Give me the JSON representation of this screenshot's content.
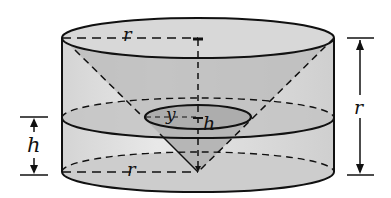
{
  "diagram": {
    "type": "geometry-figure",
    "colors": {
      "stroke": "#111111",
      "cylinder_fill": "#d9d9d9",
      "cylinder_side_light": "#e6e6e6",
      "cone_fill": "#bdbdbd",
      "section_fill": "#c8c8c8",
      "inner_disk_fill": "#b0b0b0",
      "background": "#ffffff"
    },
    "labels": {
      "top_radius": "r",
      "bottom_radius": "r",
      "section_radius": "y",
      "section_height_inner": "h",
      "left_dimension": "h",
      "right_dimension": "r"
    }
  }
}
